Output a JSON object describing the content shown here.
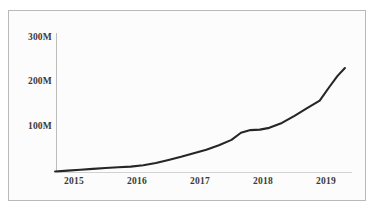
{
  "chart_data": {
    "type": "line",
    "title": "",
    "subtitle": "",
    "xlabel": "",
    "ylabel": "",
    "x_tick_labels": [
      "2015",
      "2016",
      "2017",
      "2018",
      "2019"
    ],
    "y_tick_labels": [
      "100M",
      "200M",
      "300M"
    ],
    "y_tick_values": [
      100000000,
      200000000,
      300000000
    ],
    "ylim": [
      0,
      300000000
    ],
    "xlim": [
      "2014.70",
      "2019.30"
    ],
    "grid": false,
    "legend": null,
    "legend_position": "none",
    "line_color": "#262626",
    "line_width_px": 2.1,
    "axis_color": "#bcbcbc",
    "border_color": "#b9b9b9",
    "background_color": "#fcfcfc",
    "tick_label_color": "#3a3a3a",
    "series": [
      {
        "name": "Value",
        "x": [
          2014.7,
          2014.9,
          2015.1,
          2015.3,
          2015.5,
          2015.7,
          2015.9,
          2016.1,
          2016.3,
          2016.5,
          2016.7,
          2016.9,
          2017.1,
          2017.3,
          2017.5,
          2017.65,
          2017.8,
          2017.95,
          2018.1,
          2018.3,
          2018.5,
          2018.7,
          2018.9,
          2019.05,
          2019.18,
          2019.3
        ],
        "values": [
          1000000,
          3000000,
          5000000,
          7000000,
          9000000,
          10500000,
          12000000,
          15000000,
          20000000,
          27000000,
          34000000,
          42000000,
          50000000,
          60000000,
          72000000,
          88000000,
          94000000,
          95000000,
          99000000,
          110000000,
          126000000,
          143000000,
          160000000,
          190000000,
          215000000,
          233000000
        ]
      }
    ]
  }
}
